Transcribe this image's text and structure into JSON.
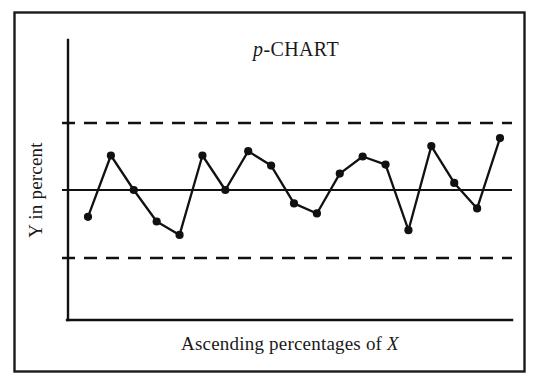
{
  "figure": {
    "frame_color": "#1a1a1a",
    "background": "#ffffff",
    "line_color": "#111111",
    "marker_color": "#111111"
  },
  "labels": {
    "title_italic_part": "p",
    "title_rest": "-CHART",
    "ylabel": "Y in percent",
    "xlabel_prefix": "Ascending percentages of ",
    "xlabel_italic_part": "X"
  },
  "chart_data": {
    "type": "line",
    "title": "p-CHART",
    "xlabel": "Ascending percentages of X",
    "ylabel": "Y in percent",
    "grid": false,
    "legend": null,
    "x": [
      1,
      2,
      3,
      4,
      5,
      6,
      7,
      8,
      9,
      10,
      11,
      12,
      13,
      14,
      15,
      16,
      17,
      18,
      19
    ],
    "xlim": [
      0,
      20
    ],
    "ylim": [
      -2.5,
      2.5
    ],
    "axis_ticks_shown": false,
    "series": [
      {
        "name": "p",
        "marker": "filled-circle",
        "values": [
          -0.8,
          1.03,
          0.0,
          -0.94,
          -1.34,
          1.03,
          0.0,
          1.16,
          0.73,
          -0.4,
          -0.7,
          0.49,
          1.0,
          0.76,
          -1.2,
          1.31,
          0.21,
          -0.55,
          1.55
        ]
      }
    ],
    "reference_lines": [
      {
        "name": "upper-control-limit",
        "label": "UCL",
        "value": 2.0,
        "style": "dashed"
      },
      {
        "name": "center-line",
        "label": "CL",
        "value": 0.0,
        "style": "solid"
      },
      {
        "name": "lower-control-limit",
        "label": "LCL",
        "value": -2.0,
        "style": "dashed"
      }
    ]
  }
}
